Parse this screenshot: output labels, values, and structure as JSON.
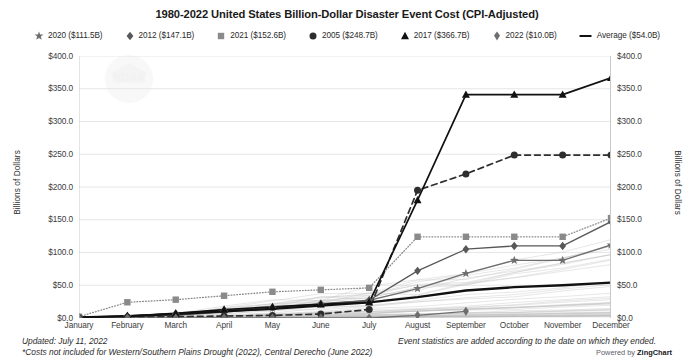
{
  "chart_data": {
    "type": "line",
    "title": "1980-2022 United States Billion-Dollar Disaster Event Cost (CPI-Adjusted)",
    "xlabel": "",
    "ylabel": "Billions of Dollars",
    "ylabel_right": "Billions of Dollars",
    "ylim": [
      0,
      400
    ],
    "yticks": [
      "$0.0",
      "$50.0",
      "$100.0",
      "$150.0",
      "$200.0",
      "$250.0",
      "$300.0",
      "$350.0",
      "$400.0"
    ],
    "ytick_values": [
      0,
      50,
      100,
      150,
      200,
      250,
      300,
      350,
      400
    ],
    "grid": true,
    "legend_position": "top",
    "categories": [
      "January",
      "February",
      "March",
      "April",
      "May",
      "June",
      "July",
      "August",
      "September",
      "October",
      "November",
      "December"
    ],
    "series": [
      {
        "name": "2020 ($111.5B)",
        "label": "2020 ($111.5B)",
        "marker": "star",
        "color": "#6e6e6e",
        "dash": "solid",
        "values": [
          0.5,
          1.5,
          4.0,
          9.0,
          15.0,
          21.0,
          27.0,
          45.0,
          68.0,
          88.0,
          88.0,
          111.5
        ]
      },
      {
        "name": "2012 ($147.1B)",
        "label": "2012 ($147.1B)",
        "marker": "diamond",
        "color": "#585858",
        "dash": "solid",
        "values": [
          1.0,
          3.0,
          7.0,
          12.0,
          16.0,
          22.0,
          27.0,
          72.0,
          105.0,
          110.0,
          110.0,
          147.1
        ]
      },
      {
        "name": "2021 ($152.6B)",
        "label": "2021 ($152.6B)",
        "marker": "square",
        "color": "#8a8a8a",
        "dash": "dotted",
        "values": [
          2.0,
          24.0,
          28.0,
          34.0,
          40.0,
          43.0,
          46.0,
          124.0,
          124.0,
          124.0,
          124.0,
          152.6
        ]
      },
      {
        "name": "2005 ($248.7B)",
        "label": "2005 ($248.7B)",
        "marker": "circle",
        "color": "#2e2e2e",
        "dash": "dashed",
        "values": [
          0.5,
          1.0,
          2.0,
          3.0,
          4.0,
          6.0,
          13.0,
          195.0,
          220.0,
          248.7,
          248.7,
          248.7
        ]
      },
      {
        "name": "2017 ($366.7B)",
        "label": "2017 ($366.7B)",
        "marker": "triangle",
        "color": "#111111",
        "dash": "solid",
        "values": [
          1.0,
          3.0,
          7.0,
          13.0,
          17.0,
          21.0,
          24.0,
          180.0,
          341.0,
          341.0,
          341.0,
          366.7
        ]
      },
      {
        "name": "2022 ($10.0B)",
        "label": "2022 ($10.0B)",
        "marker": "diamond-tall",
        "color": "#6e6e6e",
        "dash": "solid",
        "values": [
          0.0,
          0.0,
          0.0,
          0.0,
          0.0,
          0.0,
          0.0,
          4.0,
          10.0,
          null,
          null,
          null
        ]
      },
      {
        "name": "Average ($54.0B)",
        "label": "Average ($54.0B)",
        "marker": "none",
        "color": "#111111",
        "dash": "solid",
        "values": [
          1.0,
          3.0,
          6.0,
          10.0,
          14.0,
          19.0,
          24.0,
          32.0,
          42.0,
          47.0,
          50.0,
          54.0
        ]
      }
    ],
    "background_series_note": "43 faint grey lines for all years 1980-2022",
    "annotations": {
      "updated": "Updated: July 11, 2022",
      "event_note": "Event statistics are added according to the date on which they ended.",
      "costs_note": "*Costs not included for Western/Southern Plains Drought (2022), Central Derecho (June 2022)"
    }
  },
  "footer": {
    "updated": "Updated: July 11, 2022",
    "event_note": "Event statistics are added according to the date on which they ended.",
    "costs_note": "*Costs not included for Western/Southern Plains Drought (2022), Central Derecho (June 2022)",
    "powered_by_prefix": "Powered by ",
    "powered_by_brand": "ZingChart"
  }
}
